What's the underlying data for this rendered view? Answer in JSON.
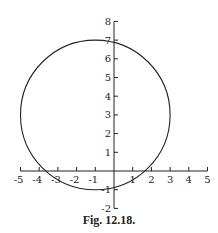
{
  "caption": "Fig. 12.18.",
  "chart_data": {
    "type": "line",
    "title": "",
    "caption": "Fig. 12.18.",
    "xlabel": "",
    "ylabel": "",
    "xlim": [
      -5,
      5
    ],
    "ylim": [
      -2,
      8
    ],
    "grid": false,
    "legend": null,
    "x_ticks": [
      -5,
      -4,
      -3,
      -2,
      -1,
      1,
      2,
      3,
      4,
      5
    ],
    "y_ticks": [
      -2,
      -1,
      1,
      2,
      3,
      4,
      5,
      6,
      7,
      8
    ],
    "series": [
      {
        "name": "circle",
        "shape": "circle",
        "center": [
          -1,
          3
        ],
        "radius": 4,
        "equation": "(x+1)^2 + (y-3)^2 = 16"
      }
    ]
  },
  "layout": {
    "origin_px": [
      114,
      171
    ],
    "unit_px": 18.7,
    "line_color": "#222222"
  }
}
